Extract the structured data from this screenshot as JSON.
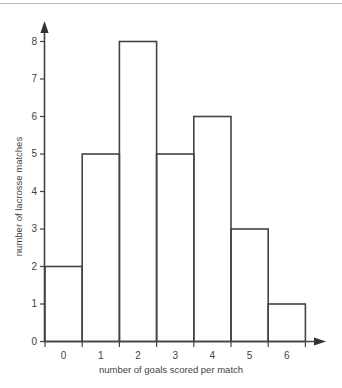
{
  "chart_data": {
    "type": "bar",
    "title": "",
    "xlabel": "number of goals scored per match",
    "ylabel": "number of lacrosse matches",
    "categories": [
      "0",
      "1",
      "2",
      "3",
      "4",
      "5",
      "6"
    ],
    "values": [
      2,
      5,
      8,
      5,
      6,
      3,
      1
    ],
    "ytick_labels": [
      "0",
      "1",
      "2",
      "3",
      "4",
      "5",
      "6",
      "7",
      "8"
    ],
    "ylim": [
      0,
      8
    ],
    "grid": false,
    "legend": null,
    "bar_style": "outline",
    "colors": {
      "stroke": "#444444",
      "background": "#ffffff",
      "text": "#3f3f3f",
      "top_rule": "#b9bcc0"
    }
  },
  "axes": {
    "y_title": "number of lacrosse matches",
    "x_title": "number of goals scored per match"
  }
}
